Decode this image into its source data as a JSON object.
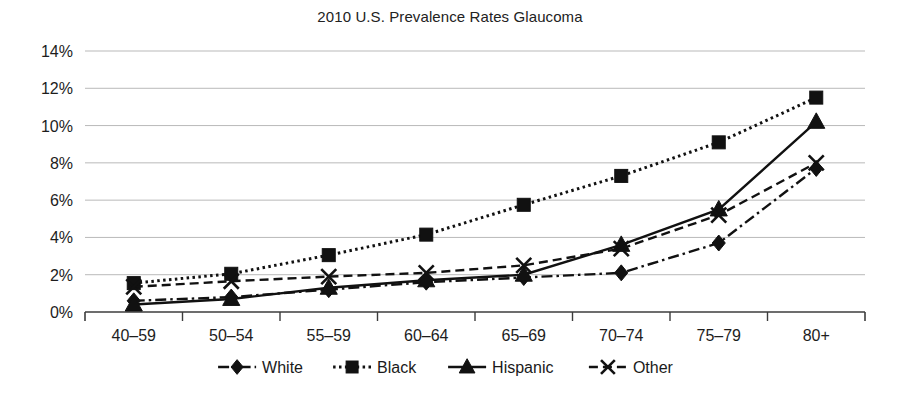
{
  "chart_data": {
    "type": "line",
    "title": "2010 U.S. Prevalence Rates Glaucoma",
    "xlabel": "",
    "ylabel": "",
    "ylim": [
      0,
      14
    ],
    "ytick_step": 2,
    "grid": true,
    "legend_position": "bottom",
    "ytick_labels": [
      "0%",
      "2%",
      "4%",
      "6%",
      "8%",
      "10%",
      "12%",
      "14%"
    ],
    "categories": [
      "40–59",
      "50–54",
      "55–59",
      "60–64",
      "65–69",
      "70–74",
      "75–79",
      "80+"
    ],
    "series": [
      {
        "name": "White",
        "marker": "diamond",
        "dash": "dashdot",
        "values": [
          0.6,
          0.8,
          1.2,
          1.6,
          1.85,
          2.1,
          3.7,
          7.7
        ]
      },
      {
        "name": "Black",
        "marker": "square",
        "dash": "dotted",
        "values": [
          1.55,
          2.05,
          3.05,
          4.15,
          5.75,
          7.3,
          9.1,
          11.5
        ]
      },
      {
        "name": "Hispanic",
        "marker": "triangle",
        "dash": "solid",
        "values": [
          0.4,
          0.7,
          1.3,
          1.7,
          2.0,
          3.6,
          5.5,
          10.2
        ]
      },
      {
        "name": "Other",
        "marker": "x",
        "dash": "dashed",
        "values": [
          1.35,
          1.65,
          1.9,
          2.1,
          2.5,
          3.4,
          5.2,
          8.0
        ]
      }
    ]
  },
  "colors": {
    "ink": "#111111",
    "grid": "#b9b9b9",
    "axis": "#3c3c3c",
    "background": "#ffffff"
  }
}
